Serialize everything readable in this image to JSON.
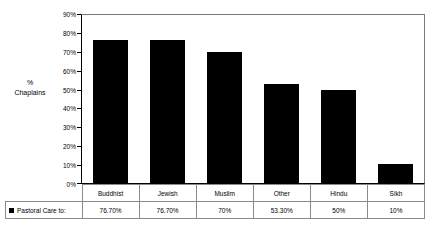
{
  "chart_data": {
    "type": "bar",
    "title": "",
    "xlabel": "",
    "ylabel": "% Chaplains",
    "ylabel_lines": [
      "%",
      "Chaplains"
    ],
    "categories": [
      "Buddhist",
      "Jewish",
      "Muslim",
      "Other",
      "Hindu",
      "Sikh"
    ],
    "values": [
      76.7,
      76.7,
      70,
      53.3,
      50,
      10
    ],
    "value_labels": [
      "76.70%",
      "76.70%",
      "70%",
      "53.30%",
      "50%",
      "10%"
    ],
    "series": [
      {
        "name": "Pastoral Care to:",
        "values": [
          76.7,
          76.7,
          70,
          53.3,
          50,
          10
        ],
        "color": "#000000"
      }
    ],
    "ylim": [
      0,
      90
    ],
    "ytick_values": [
      90,
      80,
      70,
      60,
      50,
      40,
      30,
      20,
      10,
      0
    ],
    "ytick_labels": [
      "90%",
      "80%",
      "70%",
      "60%",
      "50%",
      "40%",
      "30%",
      "20%",
      "10%",
      "0%"
    ],
    "grid": false,
    "legend_position": "bottom-left-table",
    "bar_color": "#000000"
  },
  "legend": {
    "series_label": "Pastoral Care to:",
    "swatch_color": "#000000"
  },
  "table": {
    "category_row": [
      "Buddhist",
      "Jewish",
      "Muslim",
      "Other",
      "Hindu",
      "Sikh"
    ],
    "value_row": [
      "76.70%",
      "76.70%",
      "70%",
      "53.30%",
      "50%",
      "10%"
    ]
  }
}
